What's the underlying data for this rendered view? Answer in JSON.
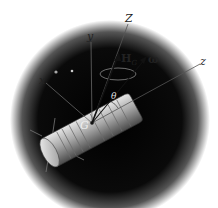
{
  "diagram": {
    "background": {
      "space_color": "#0a0a0a",
      "fade_color": "#ffffff"
    },
    "labels": {
      "x_axis": "x",
      "y_axis": "y",
      "z_axis": "z",
      "Z_axis": "Z",
      "angular_momentum": "H",
      "angular_momentum_sub": "G",
      "angular_velocity": "ω",
      "angle": "θ",
      "center_of_mass": "G"
    },
    "colors": {
      "axis_line": "#555555",
      "vector": "#111111",
      "body": "#b8b8b8"
    }
  }
}
